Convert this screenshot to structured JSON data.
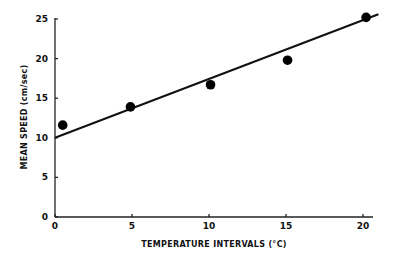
{
  "chart_data": {
    "type": "scatter",
    "title": "",
    "xlabel": "TEMPERATURE INTERVALS (°C)",
    "ylabel": "MEAN SPEED  (cm/sec)",
    "xlim": [
      0,
      21
    ],
    "ylim": [
      0,
      25
    ],
    "x_ticks": [
      0,
      5,
      10,
      15,
      20
    ],
    "y_ticks": [
      0,
      5,
      10,
      15,
      20,
      25
    ],
    "x_tick_labels": [
      "0",
      "5",
      "10",
      "15",
      "20"
    ],
    "y_tick_labels": [
      "0",
      "5",
      "10",
      "15",
      "20",
      "25"
    ],
    "grid": false,
    "legend": "none",
    "series": [
      {
        "name": "observed",
        "marker": "filled-circle",
        "x": [
          0.5,
          4.9,
          10.1,
          15.1,
          20.2
        ],
        "y": [
          11.6,
          13.9,
          16.7,
          19.8,
          25.2
        ]
      }
    ],
    "fit_line": {
      "name": "regression",
      "x": [
        0,
        21
      ],
      "y": [
        10.0,
        25.6
      ]
    }
  }
}
